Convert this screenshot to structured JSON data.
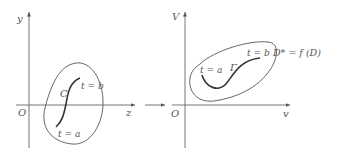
{
  "left_panel": {
    "axes": {
      "x_label": "z",
      "y_label": "y",
      "origin_label": "O"
    },
    "curve_label": "C",
    "start_label": "t = a",
    "end_label": "t = b"
  },
  "transition_arrow": {
    "icon": "right-arrow"
  },
  "right_panel": {
    "axes": {
      "x_label": "v",
      "y_label": "V",
      "origin_label": "O"
    },
    "curve_label": "Γ",
    "start_label": "t = a",
    "end_label": "t = b",
    "region_label": "D* = f (D)"
  },
  "colors": {
    "ink": "#555555",
    "curve": "#333333",
    "background": "#ffffff"
  }
}
